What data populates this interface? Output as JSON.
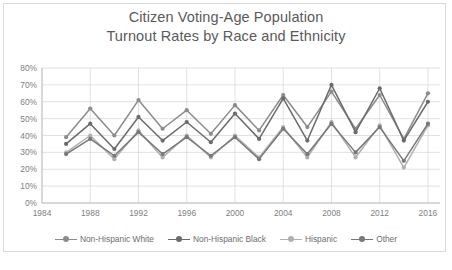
{
  "chart_data": {
    "type": "line",
    "title": "Citizen Voting-Age Population Turnout Rates by Race and Ethnicity",
    "title_lines": [
      "Citizen Voting-Age Population",
      "Turnout Rates by Race and Ethnicity"
    ],
    "xlabel": "",
    "ylabel": "",
    "ylim": [
      0,
      0.8
    ],
    "ytick_labels": [
      "0%",
      "10%",
      "20%",
      "30%",
      "40%",
      "50%",
      "60%",
      "70%",
      "80%"
    ],
    "ytick_values": [
      0,
      10,
      20,
      30,
      40,
      50,
      60,
      70,
      80
    ],
    "xtick_labels": [
      "1984",
      "1988",
      "1992",
      "1996",
      "2000",
      "2004",
      "2008",
      "2012",
      "2016"
    ],
    "xtick_values": [
      1984,
      1988,
      1992,
      1996,
      2000,
      2004,
      2008,
      2012,
      2016
    ],
    "xlim": [
      1984,
      2017
    ],
    "grid": true,
    "legend_position": "bottom",
    "x": [
      1986,
      1988,
      1990,
      1992,
      1994,
      1996,
      1998,
      2000,
      2002,
      2004,
      2006,
      2008,
      2010,
      2012,
      2014,
      2016
    ],
    "series": [
      {
        "name": "Non-Hispanic White",
        "color": "#8c8c8c",
        "values": [
          39,
          56,
          40,
          61,
          44,
          55,
          41,
          58,
          43,
          64,
          45,
          66,
          44,
          64,
          38,
          65
        ]
      },
      {
        "name": "Non-Hispanic Black",
        "color": "#6b6b6b",
        "values": [
          35,
          47,
          32,
          51,
          37,
          48,
          36,
          53,
          38,
          62,
          37,
          70,
          42,
          68,
          37,
          60
        ]
      },
      {
        "name": "Hispanic",
        "color": "#b0b0b0",
        "values": [
          30,
          40,
          26,
          43,
          27,
          40,
          27,
          40,
          27,
          45,
          27,
          48,
          27,
          46,
          21,
          46
        ]
      },
      {
        "name": "Other",
        "color": "#787878",
        "values": [
          29,
          38,
          28,
          42,
          29,
          39,
          28,
          39,
          26,
          44,
          29,
          47,
          30,
          45,
          25,
          47
        ]
      }
    ]
  },
  "legend": {
    "items": [
      {
        "label": "Non-Hispanic White"
      },
      {
        "label": "Non-Hispanic Black"
      },
      {
        "label": "Hispanic"
      },
      {
        "label": "Other"
      }
    ]
  },
  "colors": {
    "grid": "#d9d9d9",
    "axis": "#bfbfbf",
    "text": "#808080",
    "title": "#5a5a5a",
    "background": "#ffffff"
  }
}
